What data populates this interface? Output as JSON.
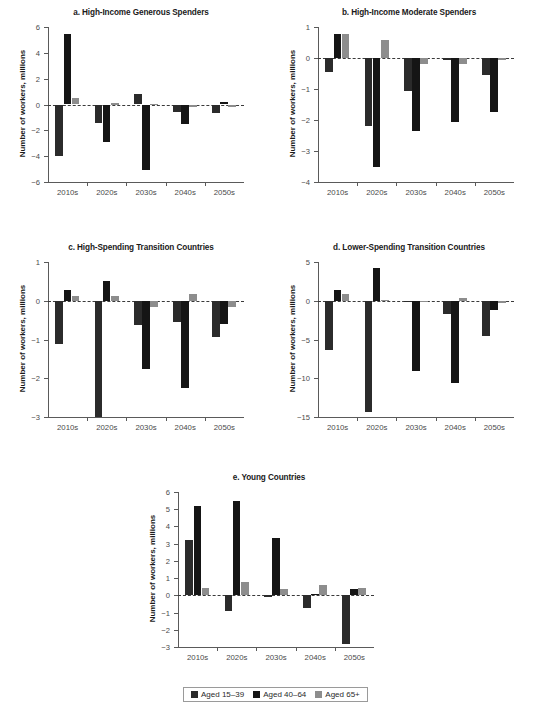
{
  "figure": {
    "ylabel": "Number of workers, millions",
    "categories": [
      "2010s",
      "2020s",
      "2030s",
      "2040s",
      "2050s"
    ],
    "colors": {
      "aged_15_39": "#2b2b2b",
      "aged_40_64": "#151515",
      "aged_65plus": "#8d8d8d"
    }
  },
  "legend": {
    "items": [
      {
        "label": "Aged 15–39",
        "color": "#2b2b2b"
      },
      {
        "label": "Aged 40–64",
        "color": "#151515"
      },
      {
        "label": "Aged 65+",
        "color": "#8d8d8d"
      }
    ]
  },
  "chart_data": [
    {
      "id": "a",
      "type": "bar",
      "title": "a. High-Income Generous Spenders",
      "xlabel": "",
      "ylabel": "Number of workers, millions",
      "categories": [
        "2010s",
        "2020s",
        "2030s",
        "2040s",
        "2050s"
      ],
      "ylim": [
        -6,
        6
      ],
      "yticks": [
        -6,
        -4,
        -2,
        0,
        2,
        4,
        6
      ],
      "ticklabels": [
        "−6",
        "−4",
        "−2",
        "0",
        "2",
        "4",
        "6"
      ],
      "grid": false,
      "legend_position": "figure-bottom",
      "series": [
        {
          "name": "Aged 15–39",
          "values": [
            -3.95,
            -1.42,
            0.8,
            -0.6,
            -0.65
          ]
        },
        {
          "name": "Aged 40–64",
          "values": [
            5.42,
            -2.9,
            -5.1,
            -1.5,
            0.18
          ]
        },
        {
          "name": "Aged 65+",
          "values": [
            0.5,
            0.15,
            0.05,
            -0.2,
            -0.2
          ]
        }
      ]
    },
    {
      "id": "b",
      "type": "bar",
      "title": "b. High-Income Moderate Spenders",
      "xlabel": "",
      "ylabel": "Number of workers, millions",
      "categories": [
        "2010s",
        "2020s",
        "2030s",
        "2040s",
        "2050s"
      ],
      "ylim": [
        -4,
        1
      ],
      "yticks": [
        -4,
        -3,
        -2,
        -1,
        0,
        1
      ],
      "ticklabels": [
        "−4",
        "−3",
        "−2",
        "−1",
        "0",
        "1"
      ],
      "grid": false,
      "legend_position": "figure-bottom",
      "series": [
        {
          "name": "Aged 15–39",
          "values": [
            -0.45,
            -2.2,
            -1.07,
            -0.08,
            -0.55
          ]
        },
        {
          "name": "Aged 40–64",
          "values": [
            0.78,
            -3.5,
            -2.35,
            -2.05,
            -1.73
          ]
        },
        {
          "name": "Aged 65+",
          "values": [
            0.78,
            0.57,
            -0.2,
            -0.18,
            -0.05
          ]
        }
      ]
    },
    {
      "id": "c",
      "type": "bar",
      "title": "c. High-Spending Transition Countries",
      "xlabel": "",
      "ylabel": "Number of workers, millions",
      "categories": [
        "2010s",
        "2020s",
        "2030s",
        "2040s",
        "2050s"
      ],
      "ylim": [
        -3,
        1
      ],
      "yticks": [
        -3,
        -2,
        -1,
        0,
        1
      ],
      "ticklabels": [
        "−3",
        "−2",
        "−1",
        "0",
        "1"
      ],
      "grid": false,
      "legend_position": "figure-bottom",
      "series": [
        {
          "name": "Aged 15–39",
          "values": [
            -1.12,
            -3.05,
            -0.62,
            -0.55,
            -0.93
          ]
        },
        {
          "name": "Aged 40–64",
          "values": [
            0.27,
            0.5,
            -1.77,
            -2.25,
            -0.6
          ]
        },
        {
          "name": "Aged 65+",
          "values": [
            0.12,
            0.13,
            -0.15,
            0.18,
            -0.15
          ]
        }
      ]
    },
    {
      "id": "d",
      "type": "bar",
      "title": "d. Lower-Spending Transition Countries",
      "xlabel": "",
      "ylabel": "Number of workers, millions",
      "categories": [
        "2010s",
        "2020s",
        "2030s",
        "2040s",
        "2050s"
      ],
      "ylim": [
        -15,
        5
      ],
      "yticks": [
        -15,
        -10,
        -5,
        0,
        5
      ],
      "ticklabels": [
        "−15",
        "−10",
        "−5",
        "0",
        "5"
      ],
      "grid": false,
      "legend_position": "figure-bottom",
      "series": [
        {
          "name": "Aged 15–39",
          "values": [
            -6.3,
            -14.3,
            -0.15,
            -1.7,
            -4.5
          ]
        },
        {
          "name": "Aged 40–64",
          "values": [
            1.4,
            4.2,
            -9.1,
            -10.6,
            -1.2
          ]
        },
        {
          "name": "Aged 65+",
          "values": [
            0.9,
            0.1,
            -0.05,
            0.3,
            -0.3
          ]
        }
      ]
    },
    {
      "id": "e",
      "type": "bar",
      "title": "e. Young Countries",
      "xlabel": "",
      "ylabel": "Number of workers, millions",
      "categories": [
        "2010s",
        "2020s",
        "2030s",
        "2040s",
        "2050s"
      ],
      "ylim": [
        -3,
        6
      ],
      "yticks": [
        -3,
        -2,
        -1,
        0,
        1,
        2,
        3,
        4,
        5,
        6
      ],
      "ticklabels": [
        "−3",
        "−2",
        "−1",
        "0",
        "1",
        "2",
        "3",
        "4",
        "5",
        "6"
      ],
      "grid": false,
      "legend_position": "figure-bottom",
      "series": [
        {
          "name": "Aged 15–39",
          "values": [
            3.2,
            -0.9,
            -0.12,
            -0.75,
            -2.85
          ]
        },
        {
          "name": "Aged 40–64",
          "values": [
            5.18,
            5.5,
            3.35,
            0.1,
            0.35
          ]
        },
        {
          "name": "Aged 65+",
          "values": [
            0.43,
            0.77,
            0.35,
            0.6,
            0.4
          ]
        }
      ]
    }
  ]
}
